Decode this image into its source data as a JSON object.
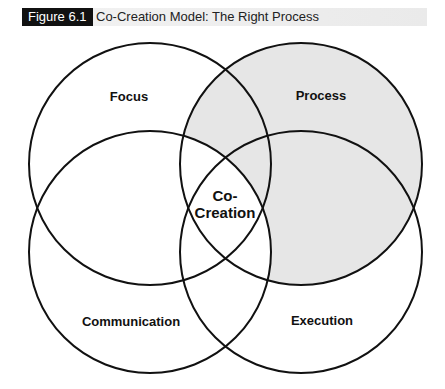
{
  "header": {
    "figure_label": "Figure 6.1",
    "title": "Co-Creation Model: The Right Process"
  },
  "diagram": {
    "type": "venn",
    "circles": [
      {
        "label": "Focus",
        "shaded": false
      },
      {
        "label": "Process",
        "shaded": true
      },
      {
        "label": "Communication",
        "shaded": false
      },
      {
        "label": "Execution",
        "shaded": false
      }
    ],
    "center_line1": "Co-",
    "center_line2": "Creation",
    "shade_color": "#e6e6e6",
    "stroke_color": "#111111"
  }
}
